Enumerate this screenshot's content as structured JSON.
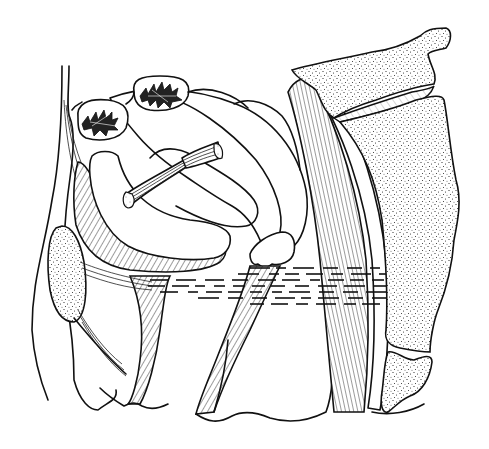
{
  "figure": {
    "type": "anatomical line drawing",
    "view": "sagittal section of female pelvis",
    "style": "black ink on white, hatching and stippling",
    "colors": {
      "ink": "#111111",
      "background": "#ffffff"
    },
    "labels": []
  },
  "regions": [
    {
      "id": "sacrum-upper",
      "texture": "stipple"
    },
    {
      "id": "sacrum-lower",
      "texture": "stipple"
    },
    {
      "id": "intervertebral-disc",
      "texture": "light-hatch"
    },
    {
      "id": "coccyx",
      "texture": "stipple"
    },
    {
      "id": "pubic-bone",
      "texture": "stipple"
    },
    {
      "id": "ovary-left",
      "texture": "spiky-follicle"
    },
    {
      "id": "ovary-right",
      "texture": "spiky-follicle"
    },
    {
      "id": "uterus",
      "texture": "none"
    },
    {
      "id": "bladder-wall",
      "texture": "diagonal-hatch"
    },
    {
      "id": "rectum-muscle",
      "texture": "vertical-hatch"
    },
    {
      "id": "pelvic-floor",
      "texture": "dashed-horizontal"
    },
    {
      "id": "round-ligament",
      "texture": "fiber-lines"
    },
    {
      "id": "vagina",
      "texture": "diagonal-hatch"
    },
    {
      "id": "urethra",
      "texture": "diagonal-hatch"
    },
    {
      "id": "abdominal-wall",
      "texture": "none"
    },
    {
      "id": "perineal-body",
      "texture": "none"
    }
  ]
}
